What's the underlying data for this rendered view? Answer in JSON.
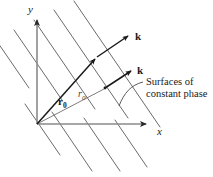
{
  "figure": {
    "name": "plane-wave-surfaces-of-constant-phase",
    "background_color": "#ffffff",
    "width": 213,
    "height": 177
  },
  "axes": {
    "x_label": "x",
    "y_label": "y",
    "origin": {
      "x": 37,
      "y": 124
    },
    "x_tip": {
      "x": 152,
      "y": 124
    },
    "y_tip": {
      "x": 37,
      "y": 14
    },
    "color": "#8a8a8a"
  },
  "vectors": {
    "position_vector": {
      "label": "r",
      "subscript": "0",
      "from": {
        "x": 37,
        "y": 124
      },
      "to": {
        "x": 98,
        "y": 56
      },
      "color": "#1a1a1a"
    },
    "scalar_distance": {
      "label": "r",
      "subscript": "0",
      "color": "#3a3a3a"
    },
    "wave_vector_upper": {
      "label": "k",
      "from": {
        "x": 98,
        "y": 56
      },
      "to": {
        "x": 131,
        "y": 34
      },
      "color": "#1a1a1a"
    },
    "wave_vector_lower": {
      "label": "k",
      "from": {
        "x": 105,
        "y": 88
      },
      "to": {
        "x": 134,
        "y": 69
      },
      "color": "#1a1a1a"
    },
    "ray_line": {
      "from": {
        "x": 37,
        "y": 124
      },
      "to": {
        "x": 107,
        "y": 87
      },
      "color": "#6e6e6e"
    }
  },
  "caption": {
    "line1": "Surfaces of",
    "line2": "constant phase",
    "leader_color": "#4a4a4a"
  },
  "surfaces": {
    "description": "parallel lines of constant phase",
    "color": "#6b6b6b",
    "stroke_width": 1.0,
    "count": 9,
    "slope": -1.45
  },
  "colors": {
    "ink": "#1a1a1a",
    "axis_gray": "#8a8a8a",
    "surface_gray": "#6b6b6b",
    "muted": "#4a4a4a"
  }
}
